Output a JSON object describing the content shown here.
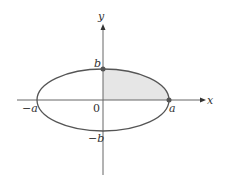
{
  "diagram": {
    "axes": {
      "x_label": "x",
      "y_label": "y"
    },
    "labels": {
      "origin": "0",
      "a_pos": "a",
      "a_neg": "−a",
      "b_pos": "b",
      "b_neg": "−b"
    },
    "colors": {
      "stroke": "#555555",
      "shade": "#e6e6e6",
      "point": "#555555"
    }
  }
}
